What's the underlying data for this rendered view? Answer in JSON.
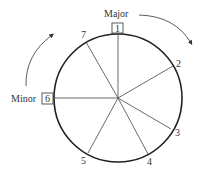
{
  "diagram": {
    "title_labels": {
      "major": "Major",
      "minor": "Minor"
    },
    "boxed": {
      "major_degree": "1",
      "minor_degree": "6"
    },
    "degrees": [
      {
        "label": "1",
        "x": 118,
        "y": 34
      },
      {
        "label": "2",
        "x": 173,
        "y": 66
      },
      {
        "label": "3",
        "x": 171,
        "y": 129
      },
      {
        "label": "4",
        "x": 148,
        "y": 154
      },
      {
        "label": "5",
        "x": 88,
        "y": 153
      },
      {
        "label": "6",
        "x": 55,
        "y": 98
      },
      {
        "label": "7",
        "x": 86,
        "y": 42
      }
    ],
    "degree_labels": {
      "d2": "2",
      "d3": "3",
      "d4": "4",
      "d5": "5",
      "d7": "7"
    },
    "colors": {
      "stroke": "#222222",
      "text": "#333333"
    }
  }
}
